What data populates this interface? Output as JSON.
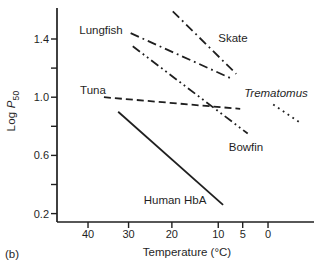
{
  "figure": {
    "panel_label": "(b)",
    "background_color": "#ffffff",
    "ink_color": "#1f1f1f"
  },
  "chart_data": {
    "type": "line",
    "title": "",
    "xlabel": "Temperature (°C)",
    "ylabel": "Log P50",
    "ylabel_parts": {
      "prefix": "Log ",
      "symbol": "P",
      "subscript": "50"
    },
    "x_scale_note": "reversed Arrhenius axis: linear in 1/K, labeled in °C, warm on left",
    "x_ticks": [
      40,
      30,
      20,
      10,
      5,
      0
    ],
    "y_ticks_labeled": [
      1.4,
      1.0,
      0.6,
      0.2
    ],
    "y_ticks_minor": [
      1.2,
      0.8,
      0.4
    ],
    "xlim_degC": [
      44,
      -10
    ],
    "ylim": [
      0.11,
      1.62
    ],
    "grid": false,
    "legend": "inline text labels next to each line",
    "series": [
      {
        "name": "Lungfish",
        "style": "dash-dot",
        "italic": false,
        "points": [
          [
            29.5,
            1.44
          ],
          [
            7.4,
            1.13
          ]
        ],
        "label_px": [
          101,
          30
        ]
      },
      {
        "name": "Skate",
        "style": "dash-dot",
        "italic": false,
        "points": [
          [
            19.8,
            1.59
          ],
          [
            6.3,
            1.16
          ]
        ],
        "label_px": [
          233,
          38
        ]
      },
      {
        "name": "Tuna",
        "style": "dashed",
        "italic": false,
        "points": [
          [
            36.0,
            1.0
          ],
          [
            5.5,
            0.92
          ]
        ],
        "label_px": [
          93,
          90
        ]
      },
      {
        "name": "Bowfin",
        "style": "dash-dot-dot",
        "italic": false,
        "points": [
          [
            29.0,
            1.35
          ],
          [
            4.0,
            0.75
          ]
        ],
        "label_px": [
          246,
          147
        ]
      },
      {
        "name": "Trematomus",
        "style": "dotted",
        "italic": true,
        "points": [
          [
            -1.0,
            0.95
          ],
          [
            -6.3,
            0.82
          ]
        ],
        "label_px": [
          276,
          93
        ]
      },
      {
        "name": "Human HbA",
        "style": "solid",
        "italic": false,
        "points": [
          [
            32.5,
            0.9
          ],
          [
            9.0,
            0.26
          ]
        ],
        "label_px": [
          175,
          200
        ]
      }
    ]
  }
}
